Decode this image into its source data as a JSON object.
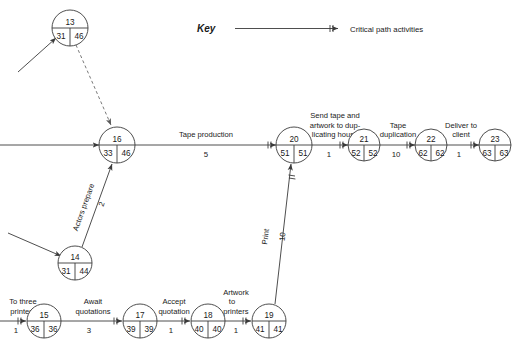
{
  "diagram": {
    "type": "network-diagram",
    "key": {
      "label": "Key",
      "description": "Critical path activities"
    },
    "nodes": [
      {
        "id": "13",
        "earliest": "31",
        "latest": "46",
        "cx": 70,
        "cy": 28,
        "r": 18
      },
      {
        "id": "16",
        "earliest": "33",
        "latest": "46",
        "cx": 117,
        "cy": 145,
        "r": 18
      },
      {
        "id": "20",
        "earliest": "51",
        "latest": "51",
        "cx": 294,
        "cy": 145,
        "r": 18
      },
      {
        "id": "21",
        "earliest": "52",
        "latest": "52",
        "cx": 364,
        "cy": 145,
        "r": 16
      },
      {
        "id": "22",
        "earliest": "62",
        "latest": "62",
        "cx": 431,
        "cy": 145,
        "r": 16
      },
      {
        "id": "23",
        "earliest": "63",
        "latest": "63",
        "cx": 495,
        "cy": 145,
        "r": 16
      },
      {
        "id": "14",
        "earliest": "31",
        "latest": "44",
        "cx": 75,
        "cy": 263,
        "r": 17
      },
      {
        "id": "15",
        "earliest": "36",
        "latest": "36",
        "cx": 44,
        "cy": 321,
        "r": 17
      },
      {
        "id": "17",
        "earliest": "39",
        "latest": "39",
        "cx": 140,
        "cy": 321,
        "r": 17
      },
      {
        "id": "18",
        "earliest": "40",
        "latest": "40",
        "cx": 208,
        "cy": 321,
        "r": 17
      },
      {
        "id": "19",
        "earliest": "41",
        "latest": "41",
        "cx": 269,
        "cy": 321,
        "r": 17
      }
    ],
    "activities": [
      {
        "name": "tape-production",
        "label_lines": [
          "Tape production"
        ],
        "duration": "5"
      },
      {
        "name": "send-tape",
        "label_lines": [
          "Send tape and",
          "artwork to dup-",
          "licating house"
        ],
        "duration": "1"
      },
      {
        "name": "tape-duplication",
        "label_lines": [
          "Tape",
          "duplication"
        ],
        "duration": "10"
      },
      {
        "name": "deliver-to-client",
        "label_lines": [
          "Deliver to",
          "client"
        ],
        "duration": "1"
      },
      {
        "name": "actors-prepare",
        "label_lines": [
          "Actors prepare"
        ],
        "duration": "2"
      },
      {
        "name": "print",
        "label_lines": [
          "Print"
        ],
        "duration": "10"
      },
      {
        "name": "to-three-printers",
        "label_lines": [
          "To three",
          "printers"
        ],
        "duration": "1"
      },
      {
        "name": "await-quotations",
        "label_lines": [
          "Await",
          "quotations"
        ],
        "duration": "3"
      },
      {
        "name": "accept-quotation",
        "label_lines": [
          "Accept",
          "quotation"
        ],
        "duration": "1"
      },
      {
        "name": "artwork-to-printers",
        "label_lines": [
          "Artwork",
          "to",
          "printers"
        ],
        "duration": "1"
      }
    ],
    "labels": {
      "tape_production": "Tape production",
      "tape_production_dur": "5",
      "send_l1": "Send tape and",
      "send_l2": "artwork to dup-",
      "send_l3": "licating house",
      "send_dur": "1",
      "tapedup_l1": "Tape",
      "tapedup_l2": "duplication",
      "tapedup_dur": "10",
      "deliver_l1": "Deliver to",
      "deliver_l2": "client",
      "deliver_dur": "1",
      "actors_prepare": "Actors prepare",
      "actors_prepare_dur": "2",
      "print": "Print",
      "print_dur": "10",
      "printers_l1": "To three",
      "printers_l2": "printers",
      "printers_dur": "1",
      "await_l1": "Await",
      "await_l2": "quotations",
      "await_dur": "3",
      "accept_l1": "Accept",
      "accept_l2": "quotation",
      "accept_dur": "1",
      "artwork_l1": "Artwork",
      "artwork_l2": "to",
      "artwork_l3": "printers",
      "artwork_dur": "1"
    },
    "colors": {
      "line": "#3a3a3a",
      "dashed_line": "#6a6a6a",
      "text": "#1a1a1a",
      "background": "#ffffff"
    }
  }
}
